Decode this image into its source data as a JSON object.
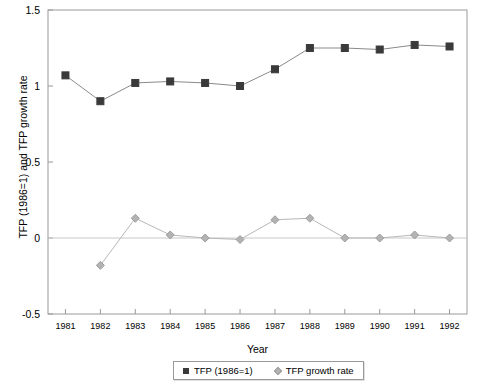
{
  "chart_data": {
    "type": "line",
    "title": "",
    "xlabel": "Year",
    "ylabel": "TFP (1986=1) and TFP growth rate",
    "categories": [
      1981,
      1982,
      1983,
      1984,
      1985,
      1986,
      1987,
      1988,
      1989,
      1990,
      1991,
      1992
    ],
    "xtick_labels": [
      "1981",
      "1982",
      "1983",
      "1984",
      "1985",
      "1986",
      "1987",
      "1988",
      "1989",
      "1990",
      "1991",
      "1992"
    ],
    "ylim": [
      -0.5,
      1.5
    ],
    "ytick_labels": [
      "1.5",
      "1",
      "0.5",
      "0",
      "-0.5"
    ],
    "ytick_values": [
      1.5,
      1.0,
      0.5,
      0.0,
      -0.5
    ],
    "grid": false,
    "zero_line": true,
    "legend_position": "below-axis-center",
    "series": [
      {
        "name": "TFP (1986=1)",
        "marker": "square",
        "color": "#3a3a3a",
        "line_color": "#8a8a8a",
        "values": [
          1.07,
          0.9,
          1.02,
          1.03,
          1.02,
          1.0,
          1.11,
          1.25,
          1.25,
          1.24,
          1.27,
          1.26
        ]
      },
      {
        "name": "TFP growth rate",
        "marker": "diamond",
        "color": "#b3b3b3",
        "line_color": "#b8b8b8",
        "values": [
          null,
          -0.18,
          0.13,
          0.02,
          0.0,
          -0.01,
          0.12,
          0.13,
          0.0,
          0.0,
          0.02,
          0.0
        ]
      }
    ]
  },
  "legend": {
    "items": [
      {
        "label": "TFP (1986=1)"
      },
      {
        "label": "TFP growth rate"
      }
    ]
  }
}
